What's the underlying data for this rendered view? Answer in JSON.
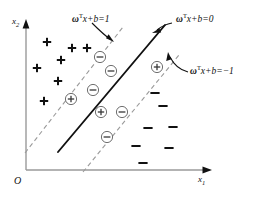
{
  "figure": {
    "background_color": "#ffffff",
    "ink_color": "#111111",
    "dashed_color": "#9a9a9a"
  },
  "axes": {
    "x_label": "x",
    "x_label_sub": "1",
    "y_label": "x",
    "y_label_sub": "2",
    "origin_label": "O"
  },
  "annotations": {
    "upper_margin": {
      "symbol": "ω",
      "sup": "T",
      "rest": "x+b=1",
      "full_text": "ωTx+b=1"
    },
    "hyperplane": {
      "symbol": "ω",
      "sup": "T",
      "rest": "x+b=0",
      "full_text": "ωTx+b=0"
    },
    "lower_margin": {
      "symbol": "ω",
      "sup": "T",
      "rest": "x+b=−1",
      "full_text": "ωTx+b=−1"
    }
  },
  "legend_semantics": {
    "plus_marker": "positive-class-sample",
    "minus_marker": "negative-class-sample",
    "circled_plus_marker": "positive-support-vector",
    "circled_minus_marker": "negative-support-vector",
    "solid_line": "decision-hyperplane",
    "dashed_line": "margin-boundary"
  },
  "chart_data": {
    "type": "scatter",
    "title": "",
    "xlabel": "x1",
    "ylabel": "x2",
    "grid": false,
    "legend": "none",
    "lines": [
      {
        "name": "upper-margin-boundary",
        "style": "dashed",
        "x1": 25,
        "y1": 153,
        "x2": 123,
        "y2": 27
      },
      {
        "name": "decision-hyperplane",
        "style": "solid",
        "x1": 58,
        "y1": 152,
        "x2": 165,
        "y2": 25
      },
      {
        "name": "lower-margin-boundary",
        "style": "dashed",
        "x1": 83,
        "y1": 172,
        "x2": 179,
        "y2": 55
      }
    ],
    "points": [
      {
        "marker": "+",
        "x": 47,
        "y": 42
      },
      {
        "marker": "+",
        "x": 72,
        "y": 48
      },
      {
        "marker": "+",
        "x": 87,
        "y": 48
      },
      {
        "marker": "+",
        "x": 61,
        "y": 60
      },
      {
        "marker": "+",
        "x": 37,
        "y": 68
      },
      {
        "marker": "+",
        "x": 58,
        "y": 81
      },
      {
        "marker": "+",
        "x": 44,
        "y": 101
      },
      {
        "marker": "⊕",
        "x": 71,
        "y": 99
      },
      {
        "marker": "⊕",
        "x": 101,
        "y": 112
      },
      {
        "marker": "⊕",
        "x": 157,
        "y": 67
      },
      {
        "marker": "⊖",
        "x": 100,
        "y": 57
      },
      {
        "marker": "⊖",
        "x": 111,
        "y": 71
      },
      {
        "marker": "⊖",
        "x": 93,
        "y": 90
      },
      {
        "marker": "⊖",
        "x": 122,
        "y": 112
      },
      {
        "marker": "⊖",
        "x": 107,
        "y": 137
      },
      {
        "marker": "-",
        "x": 155,
        "y": 93
      },
      {
        "marker": "-",
        "x": 163,
        "y": 106
      },
      {
        "marker": "-",
        "x": 173,
        "y": 127
      },
      {
        "marker": "-",
        "x": 148,
        "y": 128
      },
      {
        "marker": "-",
        "x": 169,
        "y": 148
      },
      {
        "marker": "-",
        "x": 136,
        "y": 146
      },
      {
        "marker": "-",
        "x": 143,
        "y": 163
      }
    ]
  }
}
